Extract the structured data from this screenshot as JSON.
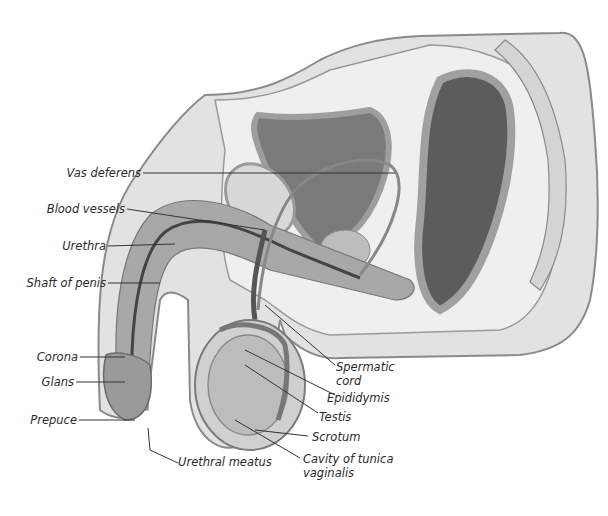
{
  "diagram": {
    "labels": {
      "vas_deferens": "Vas deferens",
      "blood_vessels": "Blood vessels",
      "urethra": "Urethra",
      "shaft_of_penis": "Shaft of penis",
      "corona": "Corona",
      "glans": "Glans",
      "prepuce": "Prepuce",
      "urethral_meatus": "Urethral meatus",
      "spermatic_cord_1": "Spermatic",
      "spermatic_cord_2": "cord",
      "epididymis": "Epididymis",
      "testis": "Testis",
      "scrotum": "Scrotum",
      "cavity_1": "Cavity of tunica",
      "cavity_2": "vaginalis"
    },
    "colors": {
      "skin": "#dcdcdc",
      "skin_edge": "#8a8a8a",
      "tissue_light": "#eeeeee",
      "tissue_mid": "#b8b8b8",
      "organ_dark": "#6e6e6e",
      "organ_darker": "#4a4a4a",
      "leader_line": "#333333"
    }
  }
}
